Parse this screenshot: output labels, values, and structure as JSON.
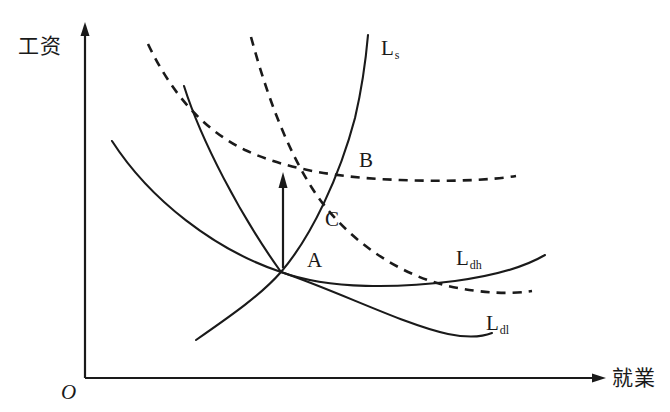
{
  "figure": {
    "type": "economics-diagram",
    "title": "",
    "background_color": "#ffffff",
    "stroke_color": "#1a1a1a",
    "axes": {
      "y_axis_label": "工资",
      "x_axis_label": "就業",
      "origin_label": "O",
      "y_axis_arrow": "up-arrow",
      "x_axis_arrow": "right-arrow"
    },
    "curves": [
      {
        "name": "labour-supply",
        "label": "L",
        "subscript": "s",
        "style": "solid",
        "description": "upward sloping labour supply curve"
      },
      {
        "name": "labour-demand-high",
        "label": "L",
        "subscript": "dh",
        "style": "solid",
        "description": "high labour demand curve, downward sloping"
      },
      {
        "name": "labour-demand-low",
        "label": "L",
        "subscript": "dl",
        "style": "solid",
        "description": "low labour demand curve, downward sloping"
      },
      {
        "name": "dashed-demand-upper",
        "label": "",
        "subscript": "",
        "style": "dashed",
        "description": "shifted dashed demand curve passing through B"
      },
      {
        "name": "dashed-demand-lower",
        "label": "",
        "subscript": "",
        "style": "dashed",
        "description": "shifted dashed demand curve passing through C"
      }
    ],
    "points": [
      {
        "name": "point-a",
        "label": "A"
      },
      {
        "name": "point-b",
        "label": "B"
      },
      {
        "name": "point-c",
        "label": "C"
      }
    ],
    "annotations": [
      {
        "name": "wage-increase-arrow",
        "label": "",
        "description": "vertical up arrow indicating wage increase"
      }
    ]
  }
}
